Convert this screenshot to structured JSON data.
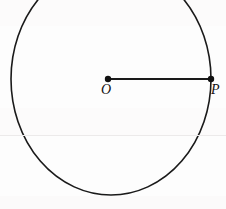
{
  "figure": {
    "type": "geometry-diagram",
    "background_color": "#fdfdfd",
    "stroke_color": "#1a1a1a",
    "labels": {
      "center": "O",
      "point_on_circle": "P"
    },
    "circle": {
      "center_x": 111,
      "center_y": 79,
      "radius_x": 100,
      "radius_y": 116,
      "stroke_width": 1.6,
      "clipped_top": true
    },
    "radius_segment": {
      "from_x": 108,
      "from_y": 79,
      "to_x": 211,
      "to_y": 79,
      "stroke_width": 2.2
    },
    "points": [
      {
        "name": "O",
        "x": 108,
        "y": 79,
        "dot_radius": 3.2
      },
      {
        "name": "P",
        "x": 211,
        "y": 79,
        "dot_radius": 3.2
      }
    ],
    "artifacts": {
      "scan_line_y": 135,
      "scan_line_color": "#eceaea"
    }
  }
}
